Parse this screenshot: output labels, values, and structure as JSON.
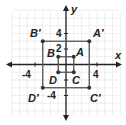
{
  "diagram": {
    "type": "coordinate-plane-dilation",
    "axes": {
      "x_label": "x",
      "y_label": "y",
      "tick_labels": {
        "x": [
          "-4",
          "4"
        ],
        "y": [
          "4",
          "2",
          "-4"
        ]
      }
    },
    "grid": {
      "xmin": -7,
      "xmax": 7,
      "ymin": -7,
      "ymax": 7,
      "unit_px": 7.75,
      "origin_px": [
        66,
        64.5
      ]
    },
    "colors": {
      "grid": "#e2e2e2",
      "axis": "#222222",
      "polygon": "#555555",
      "point": "#333333",
      "label": "#222222"
    },
    "original": {
      "name": "ABCD",
      "points": [
        {
          "label": "A",
          "x": 1,
          "y": 1
        },
        {
          "label": "B",
          "x": -1,
          "y": 1
        },
        {
          "label": "D",
          "x": -1,
          "y": -1
        },
        {
          "label": "C",
          "x": 1,
          "y": -1
        }
      ]
    },
    "image": {
      "name": "A'B'C'D'",
      "points": [
        {
          "label": "A′",
          "x": 3,
          "y": 3
        },
        {
          "label": "B′",
          "x": -3,
          "y": 3
        },
        {
          "label": "D′",
          "x": -3,
          "y": -3
        },
        {
          "label": "C′",
          "x": 3,
          "y": -3
        }
      ]
    }
  }
}
